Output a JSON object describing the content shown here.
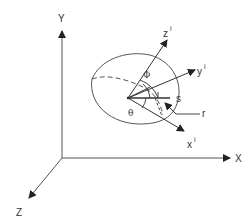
{
  "diagram": {
    "type": "coordinate-frame-diagram",
    "global_axes": {
      "x_label": "X",
      "y_label": "Y",
      "z_label": "Z"
    },
    "local_axes": {
      "x_label": "x",
      "y_label": "y",
      "z_label": "z",
      "superscript": "i"
    },
    "angles": {
      "phi": "Φ",
      "theta": "θ"
    },
    "annotations": {
      "s": "s",
      "r": "r"
    },
    "colors": {
      "line": "#444444",
      "text": "#333333",
      "background": "#ffffff"
    }
  }
}
